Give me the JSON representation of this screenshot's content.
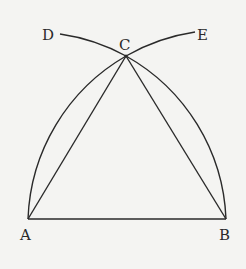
{
  "diagram": {
    "points": {
      "A": {
        "label": "A",
        "x": 28,
        "y": 219
      },
      "B": {
        "label": "B",
        "x": 226,
        "y": 219
      },
      "C": {
        "label": "C",
        "x": 126,
        "y": 56
      },
      "D": {
        "label": "D",
        "x": 60,
        "y": 34
      },
      "E": {
        "label": "E",
        "x": 195,
        "y": 32
      }
    },
    "segments": [
      [
        "A",
        "B"
      ],
      [
        "A",
        "C"
      ],
      [
        "B",
        "C"
      ]
    ],
    "arcs": [
      {
        "center": "A",
        "from": "B",
        "through": "C",
        "to": "D"
      },
      {
        "center": "B",
        "from": "A",
        "through": "C",
        "to": "E"
      }
    ],
    "colors": {
      "stroke": "#2a2a2a",
      "background": "#f4f4f2"
    }
  }
}
